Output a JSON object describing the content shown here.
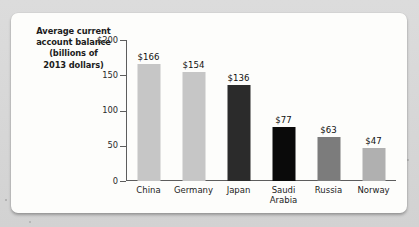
{
  "chart_data": {
    "type": "bar",
    "title": "Average current account balance (billions of 2013 dollars)",
    "title_lines": [
      "Average current",
      "account balance",
      "(billions of",
      "2013 dollars)"
    ],
    "xlabel": "",
    "ylabel": "Average current account balance (billions of 2013 dollars)",
    "categories": [
      "China",
      "Germany",
      "Japan",
      "Saudi Arabia",
      "Russia",
      "Norway"
    ],
    "category_lines": [
      [
        "China"
      ],
      [
        "Germany"
      ],
      [
        "Japan"
      ],
      [
        "Saudi",
        "Arabia"
      ],
      [
        "Russia"
      ],
      [
        "Norway"
      ]
    ],
    "values": [
      166,
      154,
      136,
      77,
      63,
      47
    ],
    "value_labels": [
      "$166",
      "$154",
      "$136",
      "$77",
      "$63",
      "$47"
    ],
    "bar_colors": [
      "#c6c6c6",
      "#c6c6c6",
      "#2b2b2b",
      "#0a0a0a",
      "#7c7c7c",
      "#b0b0b0"
    ],
    "ylim": [
      0,
      200
    ],
    "yticks": [
      0,
      50,
      100,
      150,
      200
    ],
    "ytick_labels": [
      "0",
      "50",
      "100",
      "150",
      "$200"
    ],
    "grid": false,
    "legend": "none",
    "axis_color": "#5d5d5d",
    "plot_background": "#fdfdfb",
    "page_background": "#d9d9d9"
  }
}
